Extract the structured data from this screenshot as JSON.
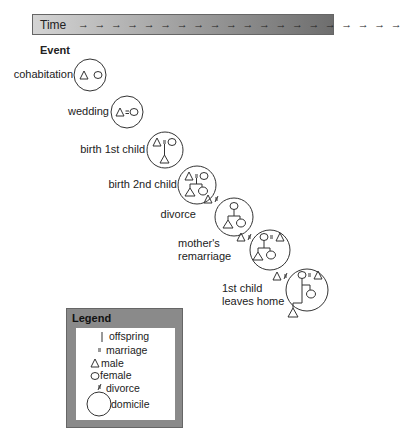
{
  "timebar": {
    "label": "Time",
    "arrows": "→ → → → → → → → → → → → → → → → → → → →"
  },
  "event_heading": "Event",
  "events": [
    {
      "label": "cohabitation"
    },
    {
      "label": "wedding"
    },
    {
      "label": "birth 1st child"
    },
    {
      "label": "birth 2nd child"
    },
    {
      "label": "divorce"
    },
    {
      "label": "mother's remarriage",
      "line1": "mother's",
      "line2": "remarriage"
    },
    {
      "label": "1st child leaves home",
      "line1": "1st child",
      "line2": "leaves home"
    }
  ],
  "symbols": {
    "marriage": "=",
    "divorce": "≠"
  },
  "legend": {
    "title": "Legend",
    "items": [
      {
        "symbol": "offspring-line",
        "label": "offspring"
      },
      {
        "symbol": "equals",
        "label": "marriage"
      },
      {
        "symbol": "triangle",
        "label": "male"
      },
      {
        "symbol": "circle",
        "label": "female"
      },
      {
        "symbol": "not-equal",
        "label": "divorce"
      },
      {
        "symbol": "large-circle",
        "label": "domicile"
      }
    ]
  },
  "colors": {
    "stroke": "#333333",
    "timebar_start": "#d4d4d4",
    "timebar_end": "#6e6e6e",
    "legend_frame": "#8a8a8a"
  }
}
